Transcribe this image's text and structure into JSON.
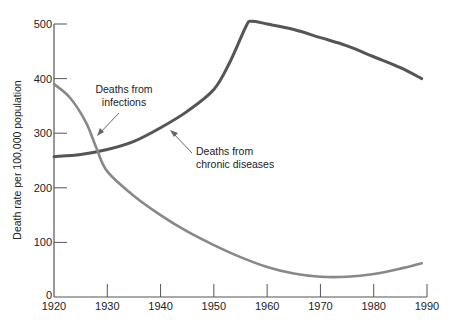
{
  "chart_data": {
    "type": "line",
    "title": "",
    "xlabel": "",
    "ylabel": "Death rate per 100,000 population",
    "xlim": [
      1920,
      1990
    ],
    "ylim": [
      0,
      500
    ],
    "grid": false,
    "legend": "none (inline annotations)",
    "x_ticks": [
      "1920",
      "1930",
      "1940",
      "1950",
      "1960",
      "1970",
      "1980",
      "1990"
    ],
    "y_ticks": [
      "0",
      "100",
      "200",
      "300",
      "400",
      "500"
    ],
    "series": [
      {
        "name": "Deaths from chronic diseases",
        "color": "#555555",
        "x": [
          1920,
          1925,
          1930,
          1935,
          1940,
          1945,
          1950,
          1953,
          1956,
          1957,
          1960,
          1965,
          1970,
          1975,
          1980,
          1985,
          1989
        ],
        "values": [
          257,
          261,
          270,
          285,
          310,
          340,
          380,
          430,
          495,
          505,
          500,
          490,
          475,
          460,
          440,
          420,
          400
        ]
      },
      {
        "name": "Deaths from infections",
        "color": "#888888",
        "x": [
          1920,
          1923,
          1926,
          1928,
          1930,
          1935,
          1940,
          1945,
          1950,
          1955,
          1960,
          1965,
          1970,
          1975,
          1980,
          1985,
          1989
        ],
        "values": [
          390,
          365,
          320,
          272,
          230,
          185,
          150,
          120,
          95,
          73,
          55,
          43,
          37,
          37,
          42,
          52,
          62
        ]
      }
    ],
    "annotations": [
      {
        "text": [
          "Deaths from",
          "infections"
        ],
        "points_to": "infections curve near 1928"
      },
      {
        "text": [
          "Deaths from",
          "chronic diseases"
        ],
        "points_to": "chronic curve near 1942"
      }
    ]
  },
  "labels": {
    "ylabel": "Death rate per 100,000 population",
    "infections_line1": "Deaths from",
    "infections_line2": "infections",
    "chronic_line1": "Deaths from",
    "chronic_line2": "chronic diseases"
  }
}
